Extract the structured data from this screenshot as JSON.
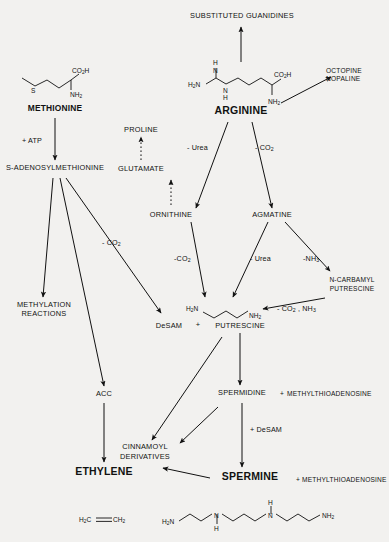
{
  "diagram": {
    "background": "#f2f1ef",
    "ink": "#111111"
  },
  "nodes": {
    "substituted_guanidines": "SUBSTITUTED GUANIDINES",
    "octopine": "OCTOPINE",
    "nopaline": "NOPALINE",
    "methionine": "METHIONINE",
    "arginine": "ARGININE",
    "sam": "S-ADENOSYLMETHIONINE",
    "proline": "PROLINE",
    "glutamate": "GLUTAMATE",
    "ornithine": "ORNITHINE",
    "agmatine": "AGMATINE",
    "methylation_reactions_1": "METHYLATION",
    "methylation_reactions_2": "REACTIONS",
    "n_carbamyl_1": "N-CARBAMYL",
    "n_carbamyl_2": "PUTRESCINE",
    "desam": "DeSAM",
    "plus_1": "+",
    "putrescine": "PUTRESCINE",
    "acc": "ACC",
    "spermidine": "SPERMIDINE",
    "plus_2": "+",
    "mta_1": "METHYLTHIOADENOSINE",
    "cinnamoyl_1": "CINNAMOYL",
    "cinnamoyl_2": "DERIVATIVES",
    "ethylene": "ETHYLENE",
    "spermine": "SPERMINE",
    "plus_3": "+",
    "mta_2": "METHYLTHIOADENOSINE"
  },
  "edge_labels": {
    "atp": "+ ATP",
    "co2_sam_desam": "- CO2",
    "urea_arg_orn": "- Urea",
    "co2_arg_agm": "- CO2",
    "co2_orn_put": "-CO2",
    "urea_agm_put": "- Urea",
    "nh3_agm_ncp": "-NH3",
    "co2_nh3_ncp_put": "- CO2 , NH3",
    "desam_spd_spm": "+ DeSAM"
  },
  "structures": {
    "methionine_formula": {
      "name": "methionine-skeletal-structure",
      "atoms": [
        "S",
        "CO2H",
        "NH2"
      ]
    },
    "arginine_formula": {
      "name": "arginine-skeletal-structure",
      "atoms": [
        "H2N",
        "H",
        "N",
        "H",
        "N",
        "CO2H",
        "NH2"
      ]
    },
    "putrescine_formula": {
      "name": "putrescine-skeletal-structure",
      "atoms": [
        "H2N",
        "NH2"
      ]
    },
    "ethylene_formula": {
      "name": "ethylene-skeletal-structure",
      "atoms": [
        "H2C",
        "CH2"
      ]
    },
    "spermine_formula": {
      "name": "spermine-skeletal-structure",
      "atoms": [
        "H2N",
        "N",
        "H",
        "N",
        "H",
        "NH2"
      ]
    }
  },
  "chart_data": {
    "type": "diagram",
    "pathway_nodes": [
      "SUBSTITUTED GUANIDINES",
      "OCTOPINE",
      "NOPALINE",
      "METHIONINE",
      "ARGININE",
      "S-ADENOSYLMETHIONINE",
      "PROLINE",
      "GLUTAMATE",
      "ORNITHINE",
      "AGMATINE",
      "METHYLATION REACTIONS",
      "N-CARBAMYL PUTRESCINE",
      "DeSAM",
      "PUTRESCINE",
      "ACC",
      "SPERMIDINE",
      "METHYLTHIOADENOSINE",
      "CINNAMOYL DERIVATIVES",
      "ETHYLENE",
      "SPERMINE"
    ],
    "edges": [
      {
        "from": "ARGININE",
        "to": "SUBSTITUTED GUANIDINES",
        "label": "",
        "style": "solid"
      },
      {
        "from": "ARGININE",
        "to": "OCTOPINE / NOPALINE",
        "label": "",
        "style": "solid"
      },
      {
        "from": "METHIONINE",
        "to": "S-ADENOSYLMETHIONINE",
        "label": "+ ATP",
        "style": "solid"
      },
      {
        "from": "ARGININE",
        "to": "ORNITHINE",
        "label": "- Urea",
        "style": "solid"
      },
      {
        "from": "ARGININE",
        "to": "AGMATINE",
        "label": "- CO2",
        "style": "solid"
      },
      {
        "from": "ORNITHINE",
        "to": "GLUTAMATE",
        "label": "",
        "style": "dotted"
      },
      {
        "from": "GLUTAMATE",
        "to": "PROLINE",
        "label": "",
        "style": "dotted"
      },
      {
        "from": "S-ADENOSYLMETHIONINE",
        "to": "METHYLATION REACTIONS",
        "label": "",
        "style": "solid"
      },
      {
        "from": "S-ADENOSYLMETHIONINE",
        "to": "ACC",
        "label": "",
        "style": "solid"
      },
      {
        "from": "S-ADENOSYLMETHIONINE",
        "to": "DeSAM",
        "label": "- CO2",
        "style": "solid"
      },
      {
        "from": "ORNITHINE",
        "to": "PUTRESCINE",
        "label": "-CO2",
        "style": "solid"
      },
      {
        "from": "AGMATINE",
        "to": "PUTRESCINE",
        "label": "- Urea",
        "style": "solid"
      },
      {
        "from": "AGMATINE",
        "to": "N-CARBAMYL PUTRESCINE",
        "label": "-NH3",
        "style": "solid"
      },
      {
        "from": "N-CARBAMYL PUTRESCINE",
        "to": "PUTRESCINE",
        "label": "- CO2 , NH3",
        "style": "solid"
      },
      {
        "from": "PUTRESCINE",
        "to": "SPERMIDINE",
        "label": "",
        "style": "solid"
      },
      {
        "from": "PUTRESCINE",
        "to": "CINNAMOYL DERIVATIVES",
        "label": "",
        "style": "solid"
      },
      {
        "from": "ACC",
        "to": "ETHYLENE",
        "label": "",
        "style": "solid"
      },
      {
        "from": "SPERMIDINE",
        "to": "SPERMINE",
        "label": "+ DeSAM",
        "style": "solid"
      },
      {
        "from": "SPERMIDINE",
        "to": "CINNAMOYL DERIVATIVES",
        "label": "",
        "style": "solid"
      },
      {
        "from": "SPERMINE",
        "to": "CINNAMOYL DERIVATIVES",
        "label": "",
        "style": "solid"
      }
    ],
    "products": [
      {
        "node": "SPERMIDINE",
        "co_product": "METHYLTHIOADENOSINE"
      },
      {
        "node": "SPERMINE",
        "co_product": "METHYLTHIOADENOSINE"
      }
    ]
  }
}
